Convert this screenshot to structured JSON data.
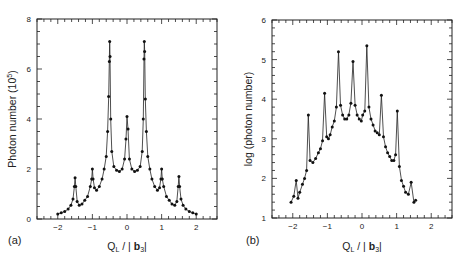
{
  "chart_data": [
    {
      "type": "line",
      "panel_label": "(a)",
      "title": "",
      "xlabel": "Q_L / |b_3|",
      "ylabel": "Photon number (10^5)",
      "xlim": [
        -2.6,
        2.6
      ],
      "ylim": [
        0,
        8
      ],
      "xticks": [
        -2,
        -1,
        0,
        1,
        2
      ],
      "yticks": [
        0,
        2,
        4,
        6,
        8
      ],
      "grid": false,
      "legend": null,
      "markers": true,
      "x": [
        -2.0,
        -1.9,
        -1.8,
        -1.7,
        -1.62,
        -1.56,
        -1.52,
        -1.5,
        -1.48,
        -1.44,
        -1.38,
        -1.3,
        -1.22,
        -1.14,
        -1.06,
        -1.02,
        -1.0,
        -0.98,
        -0.94,
        -0.88,
        -0.8,
        -0.72,
        -0.66,
        -0.6,
        -0.56,
        -0.53,
        -0.51,
        -0.5,
        -0.49,
        -0.47,
        -0.44,
        -0.38,
        -0.3,
        -0.22,
        -0.14,
        -0.07,
        -0.03,
        0.0,
        0.03,
        0.07,
        0.14,
        0.22,
        0.3,
        0.38,
        0.44,
        0.47,
        0.49,
        0.5,
        0.51,
        0.53,
        0.56,
        0.6,
        0.66,
        0.72,
        0.8,
        0.88,
        0.94,
        0.98,
        1.0,
        1.02,
        1.06,
        1.14,
        1.22,
        1.3,
        1.38,
        1.44,
        1.48,
        1.5,
        1.52,
        1.56,
        1.62,
        1.7,
        1.8,
        1.9,
        2.0
      ],
      "series": [
        {
          "name": "photon number",
          "values": [
            0.2,
            0.25,
            0.3,
            0.4,
            0.55,
            0.8,
            1.3,
            1.65,
            1.3,
            0.7,
            0.55,
            0.6,
            0.75,
            0.9,
            1.3,
            1.6,
            2.0,
            1.6,
            1.25,
            1.15,
            1.3,
            1.6,
            2.0,
            2.5,
            3.5,
            4.9,
            6.3,
            7.1,
            6.5,
            4.0,
            2.7,
            2.1,
            1.95,
            1.9,
            2.0,
            2.4,
            3.2,
            4.1,
            3.6,
            2.4,
            2.0,
            1.9,
            1.95,
            2.1,
            2.7,
            4.0,
            6.4,
            7.1,
            6.7,
            4.8,
            3.5,
            2.5,
            2.0,
            1.6,
            1.3,
            1.15,
            1.25,
            1.6,
            2.0,
            1.6,
            1.3,
            0.9,
            0.75,
            0.6,
            0.55,
            0.7,
            1.3,
            1.7,
            1.3,
            0.8,
            0.55,
            0.4,
            0.3,
            0.25,
            0.2
          ]
        }
      ]
    },
    {
      "type": "line",
      "panel_label": "(b)",
      "title": "",
      "xlabel": "Q_L / |b_3|",
      "ylabel": "log (photon number)",
      "xlim": [
        -2.6,
        2.6
      ],
      "ylim": [
        1,
        6
      ],
      "xticks": [
        -2,
        -1,
        0,
        1,
        2
      ],
      "yticks": [
        1,
        2,
        3,
        4,
        5,
        6
      ],
      "grid": false,
      "legend": null,
      "markers": true,
      "x": [
        -2.05,
        -1.97,
        -1.9,
        -1.85,
        -1.8,
        -1.72,
        -1.66,
        -1.6,
        -1.55,
        -1.5,
        -1.42,
        -1.34,
        -1.26,
        -1.2,
        -1.14,
        -1.08,
        -1.02,
        -0.97,
        -0.92,
        -0.86,
        -0.8,
        -0.74,
        -0.68,
        -0.62,
        -0.56,
        -0.5,
        -0.44,
        -0.38,
        -0.32,
        -0.26,
        -0.2,
        -0.14,
        -0.08,
        -0.02,
        0.02,
        0.08,
        0.14,
        0.2,
        0.26,
        0.32,
        0.38,
        0.44,
        0.5,
        0.56,
        0.62,
        0.68,
        0.74,
        0.8,
        0.86,
        0.92,
        0.97,
        1.02,
        1.08,
        1.14,
        1.2,
        1.26,
        1.34,
        1.42,
        1.5,
        1.55,
        1.6,
        1.66,
        1.72,
        1.8,
        1.85,
        1.9,
        1.97,
        2.02
      ],
      "series": [
        {
          "name": "log photon number",
          "values": [
            1.4,
            1.55,
            1.95,
            1.5,
            1.65,
            1.85,
            2.0,
            2.2,
            3.6,
            2.45,
            2.4,
            2.5,
            2.65,
            2.75,
            2.95,
            4.15,
            3.05,
            3.0,
            3.1,
            3.3,
            3.45,
            3.8,
            5.2,
            3.85,
            3.6,
            3.5,
            3.5,
            3.6,
            3.9,
            4.95,
            3.85,
            3.6,
            3.5,
            3.45,
            3.6,
            3.7,
            5.35,
            3.8,
            3.5,
            3.35,
            3.2,
            3.15,
            3.1,
            4.1,
            3.05,
            2.8,
            2.65,
            2.55,
            2.45,
            2.45,
            2.6,
            3.7,
            2.3,
            1.95,
            1.8,
            1.65,
            1.6,
            1.9,
            1.4,
            1.45
          ]
        }
      ]
    }
  ],
  "panels": {
    "a": {
      "label": "(a)",
      "ylabel": "Photon number (10",
      "ylabel_sup": "5",
      "ylabel_close": ")",
      "xlabel_main": "Q",
      "xlabel_sub": "L",
      "xlabel_mid": " / | ",
      "xlabel_bold": "b",
      "xlabel_sub2": "3",
      "xlabel_end": "|",
      "yticks": [
        "0",
        "2",
        "4",
        "6",
        "8"
      ],
      "xticks": [
        "-2",
        "-1",
        "0",
        "1",
        "2"
      ]
    },
    "b": {
      "label": "(b)",
      "ylabel": "log (photon number)",
      "xlabel_main": "Q",
      "xlabel_sub": "L",
      "xlabel_mid": " / | ",
      "xlabel_bold": "b",
      "xlabel_sub2": "3",
      "xlabel_end": "|",
      "yticks": [
        "1",
        "2",
        "3",
        "4",
        "5",
        "6"
      ],
      "xticks": [
        "-2",
        "-1",
        "0",
        "1",
        "2"
      ]
    }
  }
}
